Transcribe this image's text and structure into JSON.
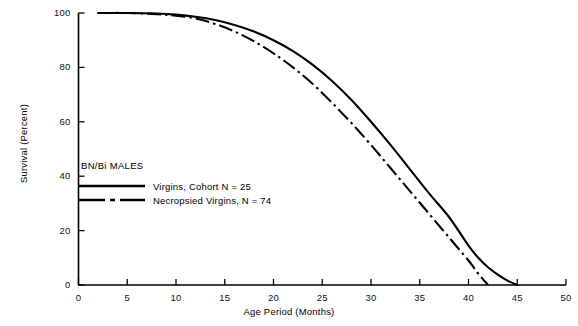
{
  "chart_data": {
    "type": "line",
    "title": "",
    "xlabel": "Age Period (Months)",
    "ylabel": "Survival (Percent)",
    "xlim": [
      0,
      50
    ],
    "ylim": [
      0,
      100
    ],
    "xticks": [
      0,
      5,
      10,
      15,
      20,
      25,
      30,
      35,
      40,
      45,
      50
    ],
    "xtick_labels": [
      "0",
      "5",
      "10",
      "15",
      "20",
      "25",
      "30",
      "35",
      "40",
      "45",
      "50"
    ],
    "yticks": [
      0,
      20,
      40,
      60,
      80,
      100
    ],
    "ytick_labels": [
      "0",
      "20",
      "40",
      "60",
      "80",
      "100"
    ],
    "grid": false,
    "legend_position": "inside-left",
    "legend_title": "BN/Bi MALES",
    "series": [
      {
        "name": "Virgins, Cohort N = 25",
        "style": "solid",
        "color": "#000000",
        "x": [
          2,
          5,
          8,
          10,
          12,
          14,
          16,
          18,
          20,
          22,
          24,
          26,
          28,
          30,
          32,
          34,
          36,
          38,
          40,
          41,
          42,
          43,
          44,
          45
        ],
        "y": [
          100,
          100,
          99.8,
          99.4,
          98.6,
          97.4,
          95.6,
          93.2,
          90.0,
          86.0,
          81.0,
          75.0,
          68.0,
          60.0,
          51.5,
          42.5,
          33.5,
          25.0,
          14.5,
          10.0,
          6.5,
          3.8,
          1.6,
          0
        ]
      },
      {
        "name": "Necropsied Virgins, N = 74",
        "style": "dash-dot",
        "color": "#000000",
        "x": [
          2,
          5,
          8,
          10,
          12,
          14,
          16,
          18,
          20,
          22,
          24,
          26,
          28,
          30,
          32,
          34,
          36,
          38,
          40,
          41,
          42
        ],
        "y": [
          100,
          100,
          99.6,
          99.0,
          98.0,
          96.0,
          93.2,
          89.6,
          85.2,
          80.0,
          74.0,
          67.0,
          59.5,
          51.5,
          43.0,
          34.5,
          26.0,
          17.5,
          9.0,
          4.2,
          0
        ]
      }
    ]
  },
  "axes": {
    "x_title": "Age Period (Months)",
    "y_title": "Survival (Percent)"
  },
  "legend": {
    "title": "BN/Bi MALES",
    "entries": [
      {
        "label": "Virgins, Cohort N = 25",
        "style": "solid"
      },
      {
        "label": "Necropsied Virgins, N = 74",
        "style": "dash-dot"
      }
    ]
  }
}
